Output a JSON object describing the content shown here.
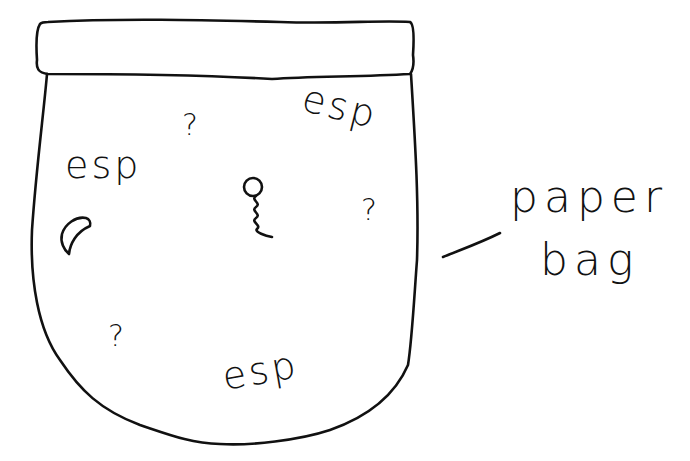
{
  "diagram": {
    "subject": "paper bag",
    "ink_color": "#111111",
    "background_color": "#ffffff",
    "bag_contents": {
      "esp_labels": [
        "esp",
        "esp",
        "esp"
      ],
      "question_marks": [
        "?",
        "?",
        "?"
      ],
      "symbols": [
        {
          "name": "sperm-icon",
          "description": "circle with wavy tail"
        },
        {
          "name": "crescent-icon",
          "description": "crescent / moon shape"
        }
      ]
    },
    "caption": {
      "line1": "paper",
      "line2": "bag"
    }
  }
}
